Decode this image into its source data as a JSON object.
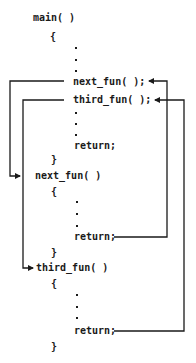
{
  "diagram": {
    "main": {
      "header": "main( )",
      "open_brace": "{",
      "call_1": "next_fun( );",
      "call_2": "third_fun( );",
      "return": "return;",
      "close_brace": "}"
    },
    "next_fun": {
      "header": "next_fun( )",
      "open_brace": "{",
      "return": "return;",
      "close_brace": "}"
    },
    "third_fun": {
      "header": "third_fun( )",
      "open_brace": "{",
      "return": "return;",
      "close_brace": "}"
    },
    "arrows": [
      {
        "from": "main.next_fun call",
        "to": "next_fun header"
      },
      {
        "from": "main.third_fun call",
        "to": "third_fun header"
      },
      {
        "from": "next_fun return",
        "to": "main.next_fun call"
      },
      {
        "from": "third_fun return",
        "to": "main.third_fun call"
      }
    ],
    "line_color": "#1a1a1a"
  }
}
